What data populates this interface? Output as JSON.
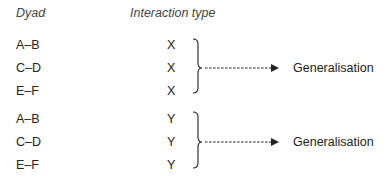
{
  "headers": {
    "dyad": "Dyad",
    "interaction_type": "Interaction type"
  },
  "groups": [
    {
      "rows": [
        {
          "dyad": "A–B",
          "type": "X"
        },
        {
          "dyad": "C–D",
          "type": "X"
        },
        {
          "dyad": "E–F",
          "type": "X"
        }
      ],
      "result": "Generalisation"
    },
    {
      "rows": [
        {
          "dyad": "A–B",
          "type": "Y"
        },
        {
          "dyad": "C–D",
          "type": "Y"
        },
        {
          "dyad": "E–F",
          "type": "Y"
        }
      ],
      "result": "Generalisation"
    }
  ]
}
